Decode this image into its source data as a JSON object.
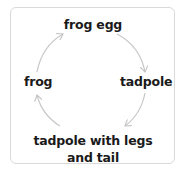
{
  "diagram": {
    "type": "cycle",
    "title": "",
    "stages": [
      {
        "id": "frog-egg",
        "label": "frog egg",
        "position": "top"
      },
      {
        "id": "tadpole",
        "label": "tadpole",
        "position": "right"
      },
      {
        "id": "tadpole-legs-tail",
        "label_line1": "tadpole with legs",
        "label_line2": "and tail",
        "position": "bottom"
      },
      {
        "id": "frog",
        "label": "frog",
        "position": "left"
      }
    ],
    "edges": [
      {
        "from": "frog-egg",
        "to": "tadpole"
      },
      {
        "from": "tadpole",
        "to": "tadpole-legs-tail"
      },
      {
        "from": "tadpole-legs-tail",
        "to": "frog"
      },
      {
        "from": "frog",
        "to": "frog-egg"
      }
    ],
    "colors": {
      "text": "#1a1a1a",
      "arrow": "#c8c8c8",
      "border": "#d9d9d9",
      "background": "#ffffff"
    }
  }
}
